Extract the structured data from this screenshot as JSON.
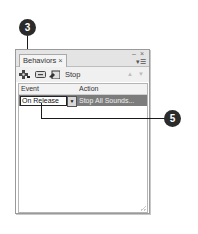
{
  "callouts": [
    {
      "number": "3"
    },
    {
      "number": "5"
    }
  ],
  "panel": {
    "tab_label": "Behaviors",
    "tab_close": "×",
    "window_controls": "– ×",
    "menu_icon": "▾☰",
    "toolbar": {
      "add_behavior_icon": "add-behavior-icon",
      "remove_behavior_icon": "remove-behavior-icon",
      "target_icon": "target-instance-icon",
      "selected_instance": "Stop",
      "move_up_arrow": "▲",
      "move_down_arrow": "▼"
    },
    "table": {
      "columns": [
        "Event",
        "Action"
      ],
      "rows": [
        {
          "event": "On Release",
          "dropdown_arrow": "▼",
          "action": "Stop All Sounds..."
        }
      ]
    }
  }
}
